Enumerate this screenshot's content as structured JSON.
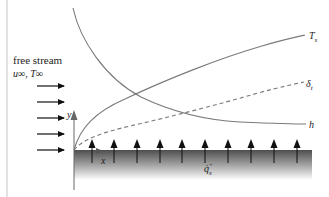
{
  "diagram": {
    "type": "boundary-layer-schematic",
    "free_stream": {
      "title": "free stream",
      "conditions": "u∞, T∞",
      "arrow_count": 5
    },
    "axes": {
      "x_label": "x",
      "y_label": "y"
    },
    "curves": [
      {
        "name": "surface-temperature",
        "label": "Ts",
        "label_main": "T",
        "label_sub": "s",
        "style": "solid"
      },
      {
        "name": "thermal-boundary-layer",
        "label": "δt",
        "label_main": "δ",
        "label_sub": "t",
        "style": "dashed"
      },
      {
        "name": "heat-transfer-coefficient",
        "label": "h",
        "style": "solid"
      }
    ],
    "plate": {
      "heat_flux_label": "q̇″s",
      "heat_flux_main": "q̇",
      "heat_flux_sup": "″",
      "heat_flux_sub": "s",
      "arrow_count": 10
    },
    "colors": {
      "curve": "#7a7a7a",
      "arrow": "#111111",
      "plate_top": "#555555",
      "plate_bottom": "#ffffff",
      "left_rule": "#bbbbbb"
    }
  }
}
